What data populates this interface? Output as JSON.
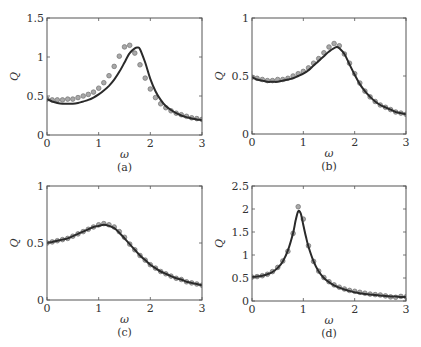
{
  "figure": {
    "panels": [
      "(a)",
      "(b)",
      "(c)",
      "(d)"
    ]
  },
  "chart_data": [
    {
      "type": "line",
      "panel_label": "(a)",
      "xlabel": "ω",
      "ylabel": "Q",
      "xlim": [
        0,
        3
      ],
      "ylim": [
        0,
        1.5
      ],
      "xticks": [
        0,
        1,
        2,
        3
      ],
      "yticks": [
        0,
        0.5,
        1,
        1.5
      ],
      "ytick_labels": [
        "0",
        "0.5",
        "1",
        "1.5"
      ],
      "grid": false,
      "series": [
        {
          "name": "model",
          "style": "line",
          "x": [
            0,
            0.1,
            0.2,
            0.3,
            0.4,
            0.5,
            0.6,
            0.7,
            0.8,
            0.9,
            1.0,
            1.1,
            1.2,
            1.3,
            1.4,
            1.5,
            1.6,
            1.7,
            1.75,
            1.8,
            1.9,
            2.0,
            2.1,
            2.2,
            2.3,
            2.4,
            2.5,
            2.6,
            2.7,
            2.8,
            2.9,
            3.0
          ],
          "y": [
            0.46,
            0.43,
            0.41,
            0.4,
            0.4,
            0.4,
            0.41,
            0.43,
            0.45,
            0.48,
            0.52,
            0.57,
            0.63,
            0.71,
            0.81,
            0.93,
            1.05,
            1.11,
            1.12,
            1.1,
            0.93,
            0.72,
            0.56,
            0.45,
            0.37,
            0.32,
            0.28,
            0.25,
            0.23,
            0.21,
            0.2,
            0.19
          ]
        },
        {
          "name": "data",
          "style": "markers",
          "x": [
            0,
            0.1,
            0.2,
            0.3,
            0.4,
            0.5,
            0.6,
            0.7,
            0.8,
            0.9,
            1.0,
            1.1,
            1.2,
            1.3,
            1.4,
            1.5,
            1.6,
            1.7,
            1.8,
            1.9,
            2.0,
            2.1,
            2.2,
            2.3,
            2.4,
            2.5,
            2.6,
            2.7,
            2.8,
            2.9,
            3.0
          ],
          "y": [
            0.46,
            0.45,
            0.45,
            0.45,
            0.46,
            0.46,
            0.48,
            0.5,
            0.52,
            0.55,
            0.6,
            0.67,
            0.76,
            0.88,
            1.01,
            1.13,
            1.15,
            1.05,
            0.9,
            0.73,
            0.59,
            0.48,
            0.4,
            0.35,
            0.31,
            0.28,
            0.26,
            0.24,
            0.22,
            0.21,
            0.2
          ]
        }
      ]
    },
    {
      "type": "line",
      "panel_label": "(b)",
      "xlabel": "ω",
      "ylabel": "Q",
      "xlim": [
        0,
        3
      ],
      "ylim": [
        0,
        1
      ],
      "xticks": [
        0,
        1,
        2,
        3
      ],
      "yticks": [
        0,
        0.5,
        1
      ],
      "ytick_labels": [
        "0",
        "0.5",
        "1"
      ],
      "grid": false,
      "series": [
        {
          "name": "model",
          "style": "line",
          "x": [
            0,
            0.1,
            0.2,
            0.3,
            0.4,
            0.5,
            0.6,
            0.7,
            0.8,
            0.9,
            1.0,
            1.1,
            1.2,
            1.3,
            1.4,
            1.5,
            1.6,
            1.65,
            1.7,
            1.8,
            1.9,
            2.0,
            2.1,
            2.2,
            2.3,
            2.4,
            2.5,
            2.6,
            2.7,
            2.8,
            2.9,
            3.0
          ],
          "y": [
            0.49,
            0.47,
            0.46,
            0.45,
            0.45,
            0.45,
            0.46,
            0.47,
            0.48,
            0.5,
            0.52,
            0.55,
            0.59,
            0.63,
            0.67,
            0.71,
            0.74,
            0.75,
            0.74,
            0.69,
            0.6,
            0.51,
            0.43,
            0.37,
            0.32,
            0.28,
            0.25,
            0.23,
            0.21,
            0.19,
            0.18,
            0.17
          ]
        },
        {
          "name": "data",
          "style": "markers",
          "x": [
            0,
            0.1,
            0.2,
            0.3,
            0.4,
            0.5,
            0.6,
            0.7,
            0.8,
            0.9,
            1.0,
            1.1,
            1.2,
            1.3,
            1.4,
            1.5,
            1.6,
            1.7,
            1.8,
            1.9,
            2.0,
            2.1,
            2.2,
            2.3,
            2.4,
            2.5,
            2.6,
            2.7,
            2.8,
            2.9,
            3.0
          ],
          "y": [
            0.49,
            0.48,
            0.47,
            0.46,
            0.46,
            0.47,
            0.47,
            0.48,
            0.5,
            0.52,
            0.54,
            0.57,
            0.61,
            0.65,
            0.7,
            0.75,
            0.78,
            0.76,
            0.69,
            0.61,
            0.52,
            0.44,
            0.37,
            0.32,
            0.28,
            0.25,
            0.23,
            0.21,
            0.19,
            0.18,
            0.17
          ]
        }
      ]
    },
    {
      "type": "line",
      "panel_label": "(c)",
      "xlabel": "ω",
      "ylabel": "Q",
      "xlim": [
        0,
        3
      ],
      "ylim": [
        0,
        1
      ],
      "xticks": [
        0,
        1,
        2,
        3
      ],
      "yticks": [
        0,
        0.5,
        1
      ],
      "ytick_labels": [
        "0",
        "0.5",
        "1"
      ],
      "grid": false,
      "series": [
        {
          "name": "model",
          "style": "line",
          "x": [
            0,
            0.1,
            0.2,
            0.3,
            0.4,
            0.5,
            0.6,
            0.7,
            0.8,
            0.9,
            1.0,
            1.1,
            1.2,
            1.3,
            1.4,
            1.5,
            1.6,
            1.7,
            1.8,
            1.9,
            2.0,
            2.1,
            2.2,
            2.3,
            2.4,
            2.5,
            2.6,
            2.7,
            2.8,
            2.9,
            3.0
          ],
          "y": [
            0.5,
            0.51,
            0.52,
            0.53,
            0.54,
            0.56,
            0.58,
            0.6,
            0.62,
            0.64,
            0.65,
            0.66,
            0.65,
            0.63,
            0.59,
            0.54,
            0.49,
            0.44,
            0.39,
            0.35,
            0.31,
            0.28,
            0.25,
            0.23,
            0.21,
            0.19,
            0.18,
            0.16,
            0.15,
            0.14,
            0.13
          ]
        },
        {
          "name": "data",
          "style": "markers",
          "x": [
            0,
            0.1,
            0.2,
            0.3,
            0.4,
            0.5,
            0.6,
            0.7,
            0.8,
            0.9,
            1.0,
            1.1,
            1.2,
            1.3,
            1.4,
            1.5,
            1.6,
            1.7,
            1.8,
            1.9,
            2.0,
            2.1,
            2.2,
            2.3,
            2.4,
            2.5,
            2.6,
            2.7,
            2.8,
            2.9,
            3.0
          ],
          "y": [
            0.5,
            0.51,
            0.52,
            0.53,
            0.54,
            0.56,
            0.58,
            0.6,
            0.62,
            0.64,
            0.66,
            0.67,
            0.66,
            0.64,
            0.6,
            0.55,
            0.49,
            0.44,
            0.39,
            0.35,
            0.31,
            0.28,
            0.25,
            0.23,
            0.21,
            0.19,
            0.18,
            0.16,
            0.15,
            0.14,
            0.13
          ]
        }
      ]
    },
    {
      "type": "line",
      "panel_label": "(d)",
      "xlabel": "ω",
      "ylabel": "Q",
      "xlim": [
        0,
        3
      ],
      "ylim": [
        0,
        2.5
      ],
      "xticks": [
        0,
        1,
        2,
        3
      ],
      "yticks": [
        0,
        0.5,
        1,
        1.5,
        2,
        2.5
      ],
      "ytick_labels": [
        "0",
        "0.5",
        "1",
        "1.5",
        "2",
        "2.5"
      ],
      "grid": false,
      "series": [
        {
          "name": "model",
          "style": "line",
          "x": [
            0,
            0.1,
            0.2,
            0.3,
            0.4,
            0.5,
            0.6,
            0.7,
            0.8,
            0.85,
            0.9,
            0.95,
            1.0,
            1.05,
            1.1,
            1.2,
            1.3,
            1.4,
            1.5,
            1.6,
            1.7,
            1.8,
            1.9,
            2.0,
            2.1,
            2.2,
            2.3,
            2.4,
            2.5,
            2.6,
            2.7,
            2.8,
            2.9,
            3.0
          ],
          "y": [
            0.52,
            0.53,
            0.55,
            0.58,
            0.63,
            0.72,
            0.86,
            1.1,
            1.48,
            1.75,
            1.95,
            1.9,
            1.65,
            1.4,
            1.18,
            0.86,
            0.64,
            0.5,
            0.41,
            0.34,
            0.29,
            0.25,
            0.22,
            0.19,
            0.17,
            0.15,
            0.14,
            0.13,
            0.12,
            0.11,
            0.1,
            0.1,
            0.09,
            0.09
          ]
        },
        {
          "name": "data",
          "style": "markers",
          "x": [
            0,
            0.1,
            0.2,
            0.3,
            0.4,
            0.5,
            0.6,
            0.7,
            0.8,
            0.9,
            1.0,
            1.1,
            1.2,
            1.3,
            1.4,
            1.5,
            1.6,
            1.7,
            1.8,
            1.9,
            2.0,
            2.1,
            2.2,
            2.3,
            2.4,
            2.5,
            2.6,
            2.7,
            2.8,
            2.9,
            3.0
          ],
          "y": [
            0.52,
            0.53,
            0.55,
            0.58,
            0.64,
            0.73,
            0.87,
            1.08,
            1.47,
            2.05,
            1.78,
            1.2,
            0.86,
            0.65,
            0.51,
            0.42,
            0.35,
            0.3,
            0.26,
            0.23,
            0.21,
            0.19,
            0.17,
            0.15,
            0.14,
            0.13,
            0.11,
            0.09,
            0.08,
            0.1,
            0.09
          ]
        }
      ]
    }
  ]
}
